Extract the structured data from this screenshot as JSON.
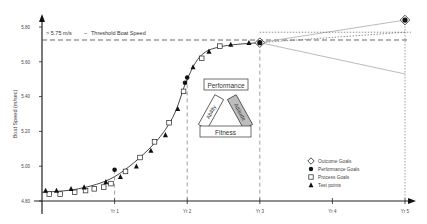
{
  "chart_data": {
    "type": "line",
    "title": "",
    "xlabel": "",
    "ylabel": "Boat Speed (m/sec)",
    "ylim": [
      4.8,
      5.8
    ],
    "xlim": [
      0,
      5
    ],
    "grid": false,
    "legend_position": "lower-right",
    "y_ticks": [
      "4.80",
      "5.00",
      "5.20",
      "5.40",
      "5.60",
      "5.80"
    ],
    "x_ticks": [
      {
        "x": 1,
        "label": "Yr 1"
      },
      {
        "x": 2,
        "label": "Yr 2"
      },
      {
        "x": 3,
        "label": "Yr 3"
      },
      {
        "x": 4,
        "label": "Yr 4"
      },
      {
        "x": 5,
        "label": "Yr 5"
      }
    ],
    "threshold": {
      "value": 5.75,
      "label_value": "> 5.75 m/s",
      "label_text": "Threshold Boat Speed"
    },
    "annotation_triangle": {
      "top": "Performance",
      "left": "Ability",
      "right": "Attitude",
      "bottom": "Fitness"
    },
    "legend": [
      {
        "marker": "open-diamond",
        "label": "Outcome Goals"
      },
      {
        "marker": "filled-circle",
        "label": "Performance Goals"
      },
      {
        "marker": "open-square",
        "label": "Process Goals"
      },
      {
        "marker": "filled-triangle",
        "label": "Test points"
      }
    ],
    "series": [
      {
        "name": "Outcome Goals",
        "marker": "open-diamond",
        "points": [
          [
            3.0,
            5.71
          ],
          [
            5.0,
            5.84
          ]
        ]
      },
      {
        "name": "Performance Goals",
        "marker": "filled-circle",
        "points": [
          [
            1.0,
            4.98
          ],
          [
            1.97,
            5.48
          ],
          [
            2.0,
            5.51
          ]
        ]
      },
      {
        "name": "Process Goals",
        "marker": "open-square",
        "points": [
          [
            0.1,
            4.84
          ],
          [
            0.25,
            4.84
          ],
          [
            0.45,
            4.85
          ],
          [
            0.6,
            4.86
          ],
          [
            0.72,
            4.87
          ],
          [
            0.85,
            4.88
          ],
          [
            0.95,
            4.9
          ],
          [
            1.15,
            4.97
          ],
          [
            1.35,
            5.05
          ],
          [
            1.55,
            5.14
          ],
          [
            1.75,
            5.25
          ],
          [
            1.95,
            5.43
          ],
          [
            2.2,
            5.62
          ],
          [
            2.45,
            5.69
          ]
        ]
      },
      {
        "name": "Test points",
        "marker": "filled-triangle",
        "points": [
          [
            0.05,
            4.86
          ],
          [
            0.2,
            4.86
          ],
          [
            0.4,
            4.87
          ],
          [
            0.58,
            4.88
          ],
          [
            0.88,
            4.91
          ],
          [
            1.08,
            4.94
          ],
          [
            1.3,
            5.0
          ],
          [
            1.5,
            5.09
          ],
          [
            1.7,
            5.18
          ],
          [
            1.87,
            5.33
          ],
          [
            2.08,
            5.57
          ],
          [
            2.3,
            5.66
          ],
          [
            2.6,
            5.7
          ],
          [
            2.85,
            5.71
          ]
        ]
      }
    ],
    "trend_curve": [
      [
        0,
        4.85
      ],
      [
        0.5,
        4.87
      ],
      [
        1.0,
        4.94
      ],
      [
        1.5,
        5.11
      ],
      [
        1.8,
        5.28
      ],
      [
        2.0,
        5.5
      ],
      [
        2.2,
        5.64
      ],
      [
        2.5,
        5.69
      ],
      [
        3.0,
        5.71
      ]
    ],
    "projections": [
      {
        "name": "upper",
        "style": "solid-light",
        "points": [
          [
            3.0,
            5.71
          ],
          [
            5.0,
            5.84
          ]
        ]
      },
      {
        "name": "target",
        "style": "dotted",
        "points": [
          [
            3.0,
            5.71
          ],
          [
            5.0,
            5.77
          ]
        ]
      },
      {
        "name": "lower",
        "style": "solid-light",
        "points": [
          [
            3.0,
            5.71
          ],
          [
            5.0,
            5.53
          ]
        ]
      }
    ]
  }
}
